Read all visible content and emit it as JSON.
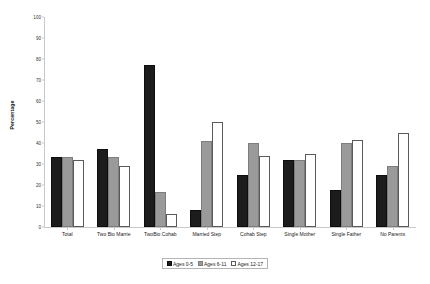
{
  "chart_data": {
    "type": "bar",
    "title": "",
    "xlabel": "",
    "ylabel": "Percentage",
    "ylim": [
      0,
      100
    ],
    "ytick_step": 10,
    "yticks": [
      0,
      10,
      20,
      30,
      40,
      50,
      60,
      70,
      80,
      90,
      100
    ],
    "grid": false,
    "legend_position": "bottom",
    "categories": [
      "Total",
      "Two Bio Marrie",
      "TwoBio Cohab",
      "Married  Step",
      "Cohab Step",
      "Single Mother",
      "Single Father",
      "No Parents"
    ],
    "series": [
      {
        "name": "Ages 0-5",
        "color": "#1c1c1c",
        "values": [
          33.5,
          37,
          77,
          8,
          25,
          32,
          17.5,
          25
        ]
      },
      {
        "name": "Ages 6-11",
        "color": "#9a9a9a",
        "values": [
          33.5,
          33.5,
          16.5,
          41,
          40,
          32,
          40,
          29
        ]
      },
      {
        "name": "Ages 12-17",
        "color": "#ffffff",
        "values": [
          32,
          29,
          6,
          50,
          34,
          35,
          41.5,
          45
        ]
      }
    ]
  },
  "legend": {
    "items": [
      {
        "label": "Ages 0-5"
      },
      {
        "label": "Ages 6-11"
      },
      {
        "label": "Ages 12-17"
      }
    ]
  }
}
